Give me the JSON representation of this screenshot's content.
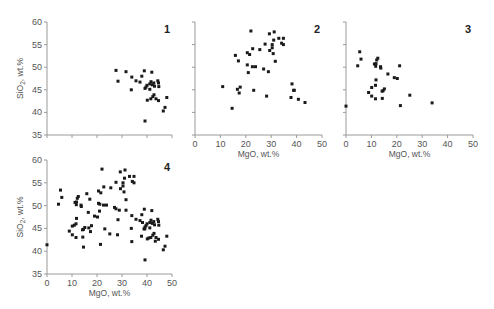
{
  "figure": {
    "marker_color": "#1a1a1a",
    "axis_color": "#9a9a9a",
    "text_color": "#555555"
  },
  "chart_data": [
    {
      "type": "scatter",
      "panel": "1",
      "title": "1",
      "xlabel": "",
      "ylabel": "SiO2, wt.%",
      "xlim": [
        0,
        50
      ],
      "ylim": [
        35,
        60
      ],
      "xticks": [
        0,
        10,
        20,
        30,
        40,
        50
      ],
      "xtick_labels": [],
      "yticks": [
        35,
        40,
        45,
        50,
        55,
        60
      ],
      "ytick_labels": [
        "35",
        "40",
        "45",
        "50",
        "55",
        "60"
      ],
      "grid": false,
      "layout": {
        "x0": 47,
        "x1": 172,
        "y0": 135,
        "y1": 22
      },
      "points": [
        [
          27.6,
          49.3
        ],
        [
          28.4,
          46.9
        ],
        [
          31.6,
          49.0
        ],
        [
          33.9,
          47.8
        ],
        [
          33.7,
          45.0
        ],
        [
          35.6,
          47.0
        ],
        [
          37.2,
          46.7
        ],
        [
          37.9,
          48.0
        ],
        [
          38.9,
          49.2
        ],
        [
          41.9,
          48.9
        ],
        [
          39.2,
          45.3
        ],
        [
          39.6,
          45.6
        ],
        [
          40.0,
          46.0
        ],
        [
          41.1,
          46.3
        ],
        [
          41.6,
          46.8
        ],
        [
          42.1,
          46.1
        ],
        [
          42.7,
          46.5
        ],
        [
          43.0,
          45.8
        ],
        [
          44.3,
          47.0
        ],
        [
          44.6,
          46.5
        ],
        [
          44.7,
          45.7
        ],
        [
          41.1,
          45.1
        ],
        [
          40.1,
          42.7
        ],
        [
          41.5,
          43.0
        ],
        [
          42.3,
          43.5
        ],
        [
          42.8,
          43.9
        ],
        [
          43.6,
          43.0
        ],
        [
          44.6,
          42.6
        ],
        [
          47.9,
          43.3
        ],
        [
          47.2,
          41.1
        ],
        [
          46.5,
          40.3
        ],
        [
          39.2,
          38.1
        ]
      ]
    },
    {
      "type": "scatter",
      "panel": "2",
      "title": "2",
      "xlabel": "MgO, wt.%",
      "ylabel": "",
      "xlim": [
        0,
        50
      ],
      "ylim": [
        35,
        60
      ],
      "xticks": [
        0,
        10,
        20,
        30,
        40,
        50
      ],
      "xtick_labels": [
        "0",
        "10",
        "20",
        "30",
        "40",
        "50"
      ],
      "yticks": [
        35,
        40,
        45,
        50,
        55,
        60
      ],
      "ytick_labels": [],
      "grid": false,
      "layout": {
        "x0": 195,
        "x1": 322,
        "y0": 135,
        "y1": 22
      },
      "points": [
        [
          22.0,
          58.0
        ],
        [
          31.2,
          57.8
        ],
        [
          29.3,
          57.4
        ],
        [
          33.0,
          56.4
        ],
        [
          34.8,
          56.4
        ],
        [
          31.0,
          56.0
        ],
        [
          34.1,
          55.3
        ],
        [
          34.8,
          55.0
        ],
        [
          27.6,
          55.1
        ],
        [
          30.4,
          55.0
        ],
        [
          30.4,
          54.3
        ],
        [
          29.4,
          53.7
        ],
        [
          30.8,
          53.0
        ],
        [
          25.5,
          53.9
        ],
        [
          22.7,
          54.1
        ],
        [
          20.6,
          53.2
        ],
        [
          21.5,
          52.8
        ],
        [
          15.9,
          52.6
        ],
        [
          17.1,
          51.4
        ],
        [
          31.6,
          51.3
        ],
        [
          20.6,
          50.5
        ],
        [
          22.6,
          50.1
        ],
        [
          23.8,
          50.1
        ],
        [
          27.0,
          49.6
        ],
        [
          21.0,
          48.8
        ],
        [
          28.9,
          49.0
        ],
        [
          10.9,
          45.7
        ],
        [
          16.7,
          45.1
        ],
        [
          17.8,
          45.6
        ],
        [
          23.1,
          44.9
        ],
        [
          17.4,
          44.3
        ],
        [
          28.2,
          43.6
        ],
        [
          14.6,
          40.9
        ],
        [
          38.2,
          46.3
        ],
        [
          39.1,
          44.9
        ],
        [
          38.8,
          44.9
        ],
        [
          37.8,
          43.3
        ],
        [
          40.7,
          42.9
        ],
        [
          43.3,
          42.2
        ]
      ]
    },
    {
      "type": "scatter",
      "panel": "3",
      "title": "3",
      "xlabel": "MgO, wt.%",
      "ylabel": "",
      "xlim": [
        0,
        50
      ],
      "ylim": [
        35,
        60
      ],
      "xticks": [
        0,
        10,
        20,
        30,
        40,
        50
      ],
      "xtick_labels": [
        "0",
        "10",
        "20",
        "30",
        "40",
        "50"
      ],
      "yticks": [
        35,
        40,
        45,
        50,
        55,
        60
      ],
      "ytick_labels": [],
      "grid": false,
      "layout": {
        "x0": 346,
        "x1": 473,
        "y0": 135,
        "y1": 22
      },
      "points": [
        [
          5.4,
          53.4
        ],
        [
          5.9,
          51.8
        ],
        [
          4.6,
          50.3
        ],
        [
          12.5,
          52.0
        ],
        [
          12.1,
          51.6
        ],
        [
          11.2,
          50.7
        ],
        [
          11.8,
          50.8
        ],
        [
          13.6,
          50.1
        ],
        [
          13.7,
          49.8
        ],
        [
          11.7,
          50.2
        ],
        [
          21.1,
          50.3
        ],
        [
          16.5,
          48.5
        ],
        [
          19.0,
          47.7
        ],
        [
          20.2,
          47.5
        ],
        [
          11.8,
          47.2
        ],
        [
          11.6,
          46.0
        ],
        [
          10.1,
          45.5
        ],
        [
          15.1,
          45.2
        ],
        [
          14.6,
          44.8
        ],
        [
          14.2,
          44.7
        ],
        [
          8.9,
          44.4
        ],
        [
          10.1,
          43.6
        ],
        [
          11.6,
          43.0
        ],
        [
          14.3,
          43.1
        ],
        [
          25.1,
          43.8
        ],
        [
          33.9,
          42.1
        ],
        [
          21.4,
          41.5
        ],
        [
          0.0,
          41.4
        ]
      ]
    },
    {
      "type": "scatter",
      "panel": "4",
      "title": "4",
      "xlabel": "MgO, wt.%",
      "ylabel": "SiO2, wt.%",
      "xlim": [
        0,
        50
      ],
      "ylim": [
        35,
        60
      ],
      "xticks": [
        0,
        10,
        20,
        30,
        40,
        50
      ],
      "xtick_labels": [
        "0",
        "10",
        "20",
        "30",
        "40",
        "50"
      ],
      "yticks": [
        35,
        40,
        45,
        50,
        55,
        60
      ],
      "ytick_labels": [
        "35",
        "40",
        "45",
        "50",
        "55",
        "60"
      ],
      "grid": false,
      "note": "combined data of panels 1-3",
      "layout": {
        "x0": 47,
        "x1": 172,
        "y0": 274,
        "y1": 160
      },
      "points": "union:1,2,3"
    }
  ]
}
